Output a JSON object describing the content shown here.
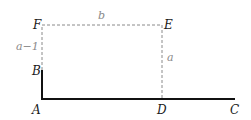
{
  "diagram": {
    "points": {
      "A": {
        "label": "A",
        "x": 42,
        "y": 99
      },
      "B": {
        "label": "B",
        "x": 42,
        "y": 70
      },
      "C": {
        "label": "C",
        "x": 235,
        "y": 99
      },
      "D": {
        "label": "D",
        "x": 162,
        "y": 99
      },
      "E": {
        "label": "E",
        "x": 162,
        "y": 25
      },
      "F": {
        "label": "F",
        "x": 42,
        "y": 25
      }
    },
    "edge_labels": {
      "FE": "b",
      "DE": "a",
      "BF": "a−1"
    },
    "solid_segments": [
      "AB",
      "AC"
    ],
    "dashed_segments": [
      "BF",
      "FE",
      "ED"
    ],
    "colors": {
      "solid": "#111111",
      "dashed": "#8a8a8a",
      "text": "#1a1a1a",
      "edge_label": "#8a8a8a"
    }
  }
}
